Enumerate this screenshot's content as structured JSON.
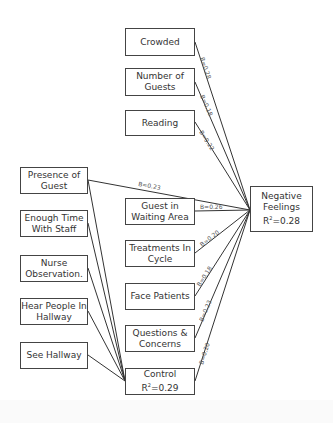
{
  "nodes": {
    "crowded": {
      "label": "Crowded"
    },
    "number_of_guests": {
      "label": "Number of Guests"
    },
    "reading": {
      "label": "Reading"
    },
    "presence_of_guest": {
      "label": "Presence of Guest"
    },
    "enough_time_with_staff": {
      "label": "Enough Time With Staff"
    },
    "nurse_observation": {
      "label": "Nurse Observation."
    },
    "hear_people_in_hallway": {
      "label": "Hear People In Hallway"
    },
    "see_hallway": {
      "label": "See Hallway"
    },
    "guest_in_waiting_area": {
      "label": "Guest in Waiting Area"
    },
    "treatments_in_cycle": {
      "label": "Treatments In Cycle"
    },
    "face_patients": {
      "label": "Face Patients"
    },
    "questions_and_concerns": {
      "label": "Questions & Concerns"
    },
    "control": {
      "label": "Control",
      "r2": "0.29"
    },
    "negative_feelings": {
      "label": "Negative Feelings",
      "r2": "0.28"
    }
  },
  "edges": [
    {
      "from": "crowded",
      "to": "negative_feelings",
      "label": "B=0.28"
    },
    {
      "from": "number_of_guests",
      "to": "negative_feelings",
      "label": "B=0.18"
    },
    {
      "from": "reading",
      "to": "negative_feelings",
      "label": "B=0.22"
    },
    {
      "from": "presence_of_guest",
      "to": "negative_feelings",
      "label": "B=0.23"
    },
    {
      "from": "guest_in_waiting_area",
      "to": "negative_feelings",
      "label": "B=0.26"
    },
    {
      "from": "treatments_in_cycle",
      "to": "negative_feelings",
      "label": "B=0.20"
    },
    {
      "from": "face_patients",
      "to": "negative_feelings",
      "label": "B=0.18"
    },
    {
      "from": "questions_and_concerns",
      "to": "negative_feelings",
      "label": "B=0.23"
    },
    {
      "from": "control",
      "to": "negative_feelings",
      "label": "B=0.20"
    },
    {
      "from": "presence_of_guest",
      "to": "control",
      "label": ""
    },
    {
      "from": "enough_time_with_staff",
      "to": "control",
      "label": ""
    },
    {
      "from": "nurse_observation",
      "to": "control",
      "label": ""
    },
    {
      "from": "hear_people_in_hallway",
      "to": "control",
      "label": ""
    },
    {
      "from": "see_hallway",
      "to": "control",
      "label": ""
    }
  ],
  "r2_prefix": "R",
  "r2_sup": "2",
  "r2_eq": "=",
  "colors": {
    "line": "#333333",
    "border": "#444444",
    "text": "#333333"
  }
}
